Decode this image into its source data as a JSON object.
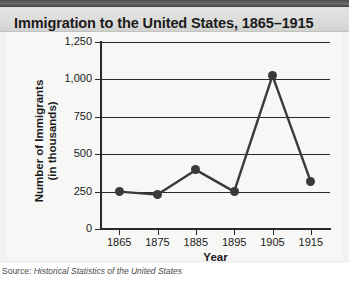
{
  "figure": {
    "title": "Immigration to the United States, 1865–1915",
    "source_label": "Source:",
    "source_text": "Historical Statistics of the United States"
  },
  "colors": {
    "line": "#3a3a3a",
    "marker": "#3a3a3a",
    "grid": "#2a2a2a",
    "title_band": "#dcdcda",
    "top_bar": "#4e4e4e",
    "panel": "#f7f7f5"
  },
  "chart_data": {
    "type": "line",
    "title": "Immigration to the United States, 1865–1915",
    "xlabel": "Year",
    "ylabel": "Number of Immigrants\n(in thousands)",
    "ylabel_line1": "Number of Immigrants",
    "ylabel_line2": "(in thousands)",
    "x": [
      1865,
      1875,
      1885,
      1895,
      1905,
      1915
    ],
    "categories": [
      "1865",
      "1875",
      "1885",
      "1895",
      "1905",
      "1915"
    ],
    "values": [
      250,
      230,
      395,
      250,
      1025,
      315
    ],
    "xlim": [
      1860,
      1920
    ],
    "ylim": [
      0,
      1250
    ],
    "yticks": [
      0,
      250,
      500,
      750,
      1000,
      1250
    ],
    "ytick_labels": [
      "0",
      "250",
      "500",
      "750",
      "1,000",
      "1,250"
    ],
    "xticks": [
      1865,
      1875,
      1885,
      1895,
      1905,
      1915
    ],
    "xtick_labels": [
      "1865",
      "1875",
      "1885",
      "1895",
      "1905",
      "1915"
    ],
    "grid": "horizontal",
    "legend": null,
    "markers": true
  }
}
